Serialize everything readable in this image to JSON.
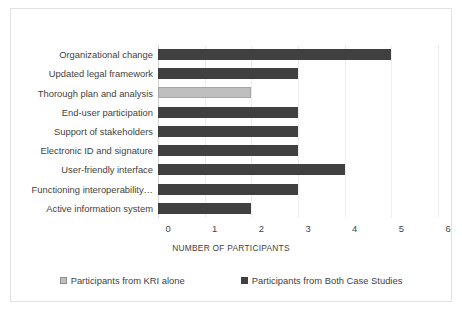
{
  "chart_data": {
    "type": "bar",
    "orientation": "horizontal",
    "title": "",
    "xlabel": "NUMBER OF PARTICIPANTS",
    "ylabel": "",
    "xlim": [
      0,
      6
    ],
    "xticks": [
      "0",
      "1",
      "2",
      "3",
      "4",
      "5",
      "6"
    ],
    "grid": true,
    "legend_position": "bottom",
    "categories": [
      "Organizational change",
      "Updated legal framework",
      "Thorough plan and analysis",
      "End-user participation",
      "Support of stakeholders",
      "Electronic ID and signature",
      "User-friendly interface",
      "Functioning interoperability…",
      "Active information system"
    ],
    "series": [
      {
        "name": "Participants from KRI alone",
        "color": "#bfbfbf",
        "values": [
          0,
          0,
          2,
          0,
          0,
          0,
          0,
          0,
          0
        ]
      },
      {
        "name": "Participants from Both Case Studies",
        "color": "#404040",
        "values": [
          5,
          3,
          0,
          3,
          3,
          3,
          4,
          3,
          2
        ]
      }
    ],
    "bars": [
      {
        "category": "Organizational change",
        "value": 5,
        "series": "Participants from Both Case Studies"
      },
      {
        "category": "Updated legal framework",
        "value": 3,
        "series": "Participants from Both Case Studies"
      },
      {
        "category": "Thorough plan and analysis",
        "value": 2,
        "series": "Participants from KRI alone"
      },
      {
        "category": "End-user participation",
        "value": 3,
        "series": "Participants from Both Case Studies"
      },
      {
        "category": "Support of stakeholders",
        "value": 3,
        "series": "Participants from Both Case Studies"
      },
      {
        "category": "Electronic ID and signature",
        "value": 3,
        "series": "Participants from Both Case Studies"
      },
      {
        "category": "User-friendly interface",
        "value": 4,
        "series": "Participants from Both Case Studies"
      },
      {
        "category": "Functioning interoperability…",
        "value": 3,
        "series": "Participants from Both Case Studies"
      },
      {
        "category": "Active information system",
        "value": 2,
        "series": "Participants from Both Case Studies"
      }
    ]
  },
  "legend": {
    "items": [
      {
        "label": "Participants from KRI alone",
        "color": "#bfbfbf"
      },
      {
        "label": "Participants from Both Case Studies",
        "color": "#404040"
      }
    ]
  },
  "colors": {
    "series_kri": "#bfbfbf",
    "series_both": "#404040",
    "gridline": "#ededed",
    "frame_border": "#e2e2e2",
    "text": "#3f3f3f",
    "background": "#ffffff"
  }
}
